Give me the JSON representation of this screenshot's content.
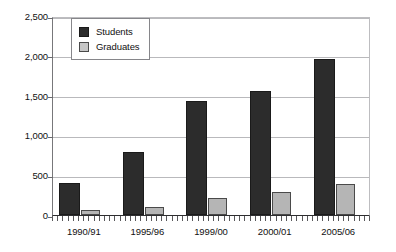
{
  "chart_data": {
    "type": "bar",
    "title": "",
    "xlabel": "",
    "ylabel": "",
    "categories": [
      "1990/91",
      "1995/96",
      "1999/00",
      "2000/01",
      "2005/06"
    ],
    "series": [
      {
        "name": "Students",
        "color": "#2c2c2c",
        "values": [
          400,
          790,
          1430,
          1560,
          1960
        ]
      },
      {
        "name": "Graduates",
        "color": "#b5b5b5",
        "values": [
          65,
          100,
          215,
          290,
          390
        ]
      }
    ],
    "ylim": [
      0,
      2500
    ],
    "ytick_values": [
      0,
      500,
      1000,
      1500,
      2000,
      2500
    ],
    "ytick_labels": [
      "0",
      "500",
      "1,000",
      "1,500",
      "2,000",
      "2,500"
    ],
    "grid": true,
    "legend_position": "top-left-inside"
  },
  "legend": {
    "items": [
      {
        "label": "Students"
      },
      {
        "label": "Graduates"
      }
    ]
  }
}
